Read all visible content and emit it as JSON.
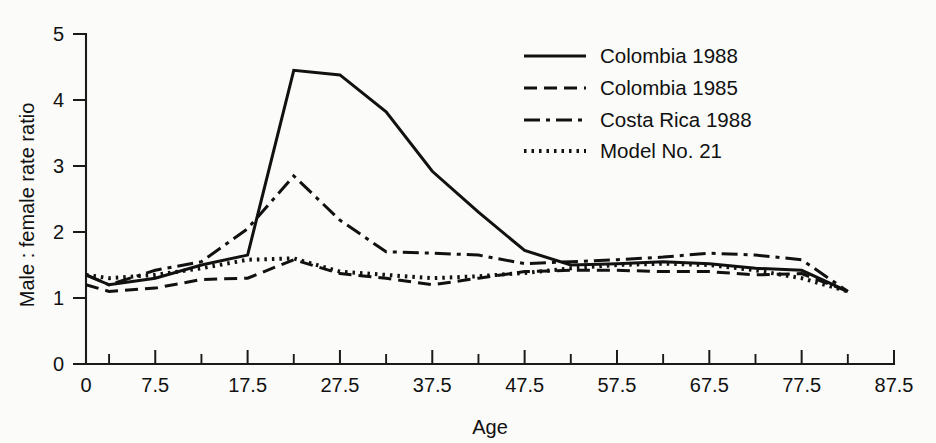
{
  "chart_data": {
    "type": "line",
    "title": "",
    "xlabel": "Age",
    "ylabel": "Male : female rate ratio",
    "xlim": [
      0,
      87.5
    ],
    "ylim": [
      0,
      5
    ],
    "grid": false,
    "legend_position": "top-right",
    "xticks": [
      0,
      7.5,
      17.5,
      27.5,
      37.5,
      47.5,
      57.5,
      67.5,
      77.5,
      87.5
    ],
    "xtick_labels": [
      "0",
      "7.5",
      "17.5",
      "27.5",
      "37.5",
      "47.5",
      "57.5",
      "67.5",
      "77.5",
      "87.5"
    ],
    "xminor_ticks": [
      2.5,
      12.5,
      22.5,
      32.5,
      42.5,
      52.5,
      62.5,
      72.5,
      82.5
    ],
    "yticks": [
      0,
      1,
      2,
      3,
      4,
      5
    ],
    "ytick_labels": [
      "0",
      "1",
      "2",
      "3",
      "4",
      "5"
    ],
    "series": [
      {
        "name": "Colombia 1988",
        "style": "solid",
        "dasharray": "",
        "width": 3.0,
        "x": [
          0,
          2.5,
          7.5,
          12.5,
          17.5,
          22.5,
          27.5,
          32.5,
          37.5,
          42.5,
          47.5,
          52.5,
          57.5,
          62.5,
          67.5,
          72.5,
          77.5,
          82.5
        ],
        "y": [
          1.35,
          1.2,
          1.3,
          1.5,
          1.65,
          4.45,
          4.38,
          3.82,
          2.92,
          2.3,
          1.72,
          1.5,
          1.52,
          1.55,
          1.52,
          1.45,
          1.42,
          1.1
        ]
      },
      {
        "name": "Colombia 1985",
        "style": "dashed",
        "dasharray": "13,7",
        "width": 3.0,
        "x": [
          0,
          2.5,
          7.5,
          12.5,
          17.5,
          22.5,
          27.5,
          32.5,
          37.5,
          42.5,
          47.5,
          52.5,
          57.5,
          62.5,
          67.5,
          72.5,
          77.5,
          82.5
        ],
        "y": [
          1.2,
          1.1,
          1.15,
          1.28,
          1.3,
          1.58,
          1.37,
          1.3,
          1.2,
          1.3,
          1.4,
          1.42,
          1.42,
          1.4,
          1.4,
          1.35,
          1.37,
          1.1
        ]
      },
      {
        "name": "Costa Rica 1988",
        "style": "dashdot",
        "dasharray": "16,6,4,6",
        "width": 3.0,
        "x": [
          0,
          2.5,
          7.5,
          12.5,
          17.5,
          22.5,
          27.5,
          32.5,
          37.5,
          42.5,
          47.5,
          52.5,
          57.5,
          62.5,
          67.5,
          72.5,
          77.5,
          82.5
        ],
        "y": [
          1.35,
          1.2,
          1.42,
          1.55,
          2.05,
          2.85,
          2.18,
          1.7,
          1.68,
          1.65,
          1.52,
          1.55,
          1.58,
          1.62,
          1.68,
          1.65,
          1.58,
          1.1
        ]
      },
      {
        "name": "Model No. 21",
        "style": "dotted",
        "dasharray": "2.5,5",
        "width": 4.0,
        "x": [
          0,
          2.5,
          7.5,
          12.5,
          17.5,
          22.5,
          27.5,
          32.5,
          37.5,
          42.5,
          47.5,
          52.5,
          57.5,
          62.5,
          67.5,
          72.5,
          77.5,
          82.5
        ],
        "y": [
          1.35,
          1.3,
          1.35,
          1.45,
          1.58,
          1.6,
          1.4,
          1.35,
          1.3,
          1.33,
          1.38,
          1.45,
          1.5,
          1.52,
          1.5,
          1.42,
          1.3,
          1.1
        ]
      }
    ]
  },
  "legend": {
    "entries": [
      {
        "label": "Colombia 1988",
        "style": "solid"
      },
      {
        "label": "Colombia 1985",
        "style": "dashed"
      },
      {
        "label": "Costa Rica 1988",
        "style": "dashdot"
      },
      {
        "label": "Model No. 21",
        "style": "dotted"
      }
    ]
  },
  "colors": {
    "ink": "#111111",
    "background": "#fbfbf9"
  }
}
